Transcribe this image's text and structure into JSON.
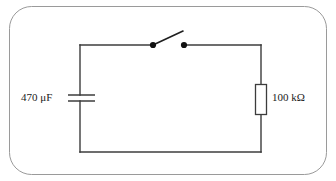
{
  "figure": {
    "background_color": "#ffffff",
    "frame": {
      "name": "rounded-frame",
      "stroke_color": "#9a9a9a",
      "stroke_width": 1,
      "corner_radius": 22,
      "x": 9,
      "y": 6,
      "width": 318,
      "height": 169
    }
  },
  "circuit": {
    "wire_color": "#3c3c3c",
    "wire_width": 1.4,
    "loop": {
      "left": 80,
      "right": 261,
      "top": 45,
      "bottom": 152
    },
    "components": [
      {
        "id": "capacitor",
        "type": "capacitor",
        "label": "470 μF",
        "value": "470",
        "unit": "μF",
        "orientation": "horizontal-plates",
        "position": {
          "x": 80,
          "y": 98
        },
        "plate_span_x": [
          68,
          95
        ],
        "plate_y": [
          95,
          101
        ]
      },
      {
        "id": "resistor",
        "type": "resistor",
        "label": "100 kΩ",
        "value": "100",
        "unit": "kΩ",
        "orientation": "vertical",
        "position": {
          "x": 261,
          "y": 99
        },
        "box": {
          "x": 255,
          "y": 84,
          "width": 12,
          "height": 31
        }
      },
      {
        "id": "switch",
        "type": "switch",
        "state": "open",
        "label": "",
        "terminal_left": {
          "x": 153,
          "y": 45
        },
        "terminal_right": {
          "x": 184,
          "y": 45
        },
        "lever_tip": {
          "x": 183,
          "y": 31
        },
        "dot_radius": 3.1
      }
    ]
  },
  "labels": {
    "capacitor": "470 μF",
    "resistor": "100 kΩ"
  }
}
